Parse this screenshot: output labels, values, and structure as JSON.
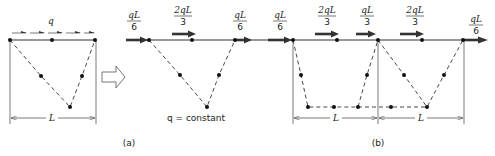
{
  "figure": {
    "panel_a": {
      "caption": "(a)",
      "original": {
        "load_label": "q",
        "span_label": "L",
        "nodes_top": [
          [
            10,
            40
          ],
          [
            52,
            40
          ],
          [
            95,
            40
          ]
        ],
        "nodes_cable": [
          [
            41,
            76
          ],
          [
            82,
            76
          ],
          [
            70,
            107
          ]
        ]
      },
      "equivalent": {
        "note": "q = constant",
        "forces": [
          {
            "num": "qL",
            "den": "6",
            "x": 134
          },
          {
            "num": "2qL",
            "den": "3",
            "x": 183
          },
          {
            "num": "qL",
            "den": "6",
            "x": 240
          }
        ],
        "nodes_top": [
          [
            149,
            40
          ],
          [
            192,
            40
          ],
          [
            235,
            40
          ]
        ],
        "nodes_cable": [
          [
            180,
            75
          ],
          [
            219,
            75
          ],
          [
            207,
            107
          ]
        ]
      },
      "transform_arrow": "hollow-right-arrow"
    },
    "panel_b": {
      "caption": "(b)",
      "span_labels": [
        "L",
        "L"
      ],
      "forces": [
        {
          "num": "qL",
          "den": "6",
          "x": 251
        },
        {
          "num": "qL",
          "den": "6",
          "x": 280
        },
        {
          "num": "2qL",
          "den": "3",
          "x": 327
        },
        {
          "num": "qL",
          "den": "3",
          "x": 367
        },
        {
          "num": "2qL",
          "den": "3",
          "x": 415
        },
        {
          "num": "qL",
          "den": "6",
          "x": 476
        }
      ],
      "nodes_top": [
        [
          293,
          40
        ],
        [
          337,
          40
        ],
        [
          378,
          40
        ],
        [
          422,
          40
        ],
        [
          463,
          40
        ]
      ]
    }
  }
}
